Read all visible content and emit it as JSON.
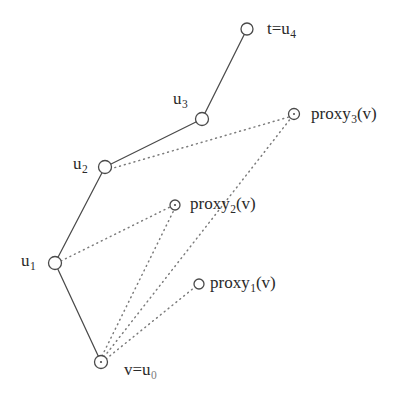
{
  "figure": {
    "type": "diagram",
    "kind": "node-link graph",
    "background_color": "#ffffff",
    "stroke_color": "#4a4a4a",
    "text_color": "#2a2a2a",
    "width": 411,
    "height": 410,
    "nodes": [
      {
        "id": "u4",
        "label_html": "t=u<sub>4</sub>",
        "label_text": "t=u4",
        "cx": 247,
        "cy": 29,
        "r": 6.0,
        "label_pos": "right"
      },
      {
        "id": "u3",
        "label_html": "u<sub>3</sub>",
        "label_text": "u3",
        "cx": 202,
        "cy": 119,
        "r": 6.5,
        "label_pos": "upper-left"
      },
      {
        "id": "proxy3",
        "label_html": "proxy<sub>3</sub>(v)",
        "label_text": "proxy3(v)",
        "cx": 294,
        "cy": 114,
        "r": 5.5,
        "label_pos": "right"
      },
      {
        "id": "u2",
        "label_html": "u<sub>2</sub>",
        "label_text": "u2",
        "cx": 105,
        "cy": 167,
        "r": 6.5,
        "label_pos": "left"
      },
      {
        "id": "proxy2",
        "label_html": "proxy<sub>2</sub>(v)",
        "label_text": "proxy2(v)",
        "cx": 175,
        "cy": 205,
        "r": 5.0,
        "label_pos": "right"
      },
      {
        "id": "u1",
        "label_html": "u<sub>1</sub>",
        "label_text": "u1",
        "cx": 55,
        "cy": 263,
        "r": 6.5,
        "label_pos": "left"
      },
      {
        "id": "proxy1",
        "label_html": "proxy<sub>1</sub>(v)",
        "label_text": "proxy1(v)",
        "cx": 199,
        "cy": 284,
        "r": 5.0,
        "label_pos": "right"
      },
      {
        "id": "u0",
        "label_html": "v=u<sub>0</sub>",
        "label_text": "v=u0",
        "cx": 101,
        "cy": 362,
        "r": 6.5,
        "label_pos": "lower-right"
      }
    ],
    "edges_solid": [
      {
        "from": "u0",
        "to": "u1"
      },
      {
        "from": "u1",
        "to": "u2"
      },
      {
        "from": "u2",
        "to": "u3"
      },
      {
        "from": "u3",
        "to": "u4"
      }
    ],
    "edges_dotted": [
      {
        "from": "u2",
        "to": "proxy3"
      },
      {
        "from": "u1",
        "to": "proxy2"
      },
      {
        "from": "u0",
        "to": "proxy3"
      },
      {
        "from": "u0",
        "to": "proxy2"
      },
      {
        "from": "u0",
        "to": "proxy1"
      }
    ]
  }
}
